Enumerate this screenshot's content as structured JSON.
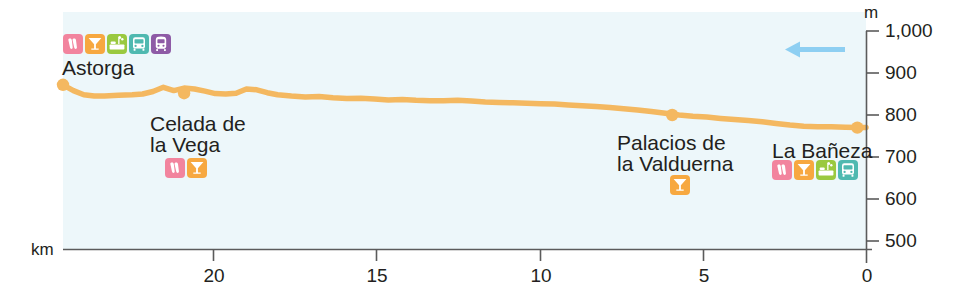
{
  "chart_data": {
    "type": "area",
    "title": "",
    "subtitle": "",
    "xlabel": "km",
    "ylabel": "m",
    "grid": false,
    "legend_position": "none",
    "xlim": [
      23.2,
      0
    ],
    "ylim": [
      500,
      1000
    ],
    "x_ticks": [
      "20",
      "15",
      "10",
      "5",
      "0"
    ],
    "x_tick_values": [
      20,
      15,
      10,
      5,
      0
    ],
    "y_ticks": [
      "500",
      "600",
      "700",
      "800",
      "900",
      "1,000"
    ],
    "y_tick_values": [
      500,
      600,
      700,
      800,
      900,
      1000
    ],
    "x_axis_direction": "descending",
    "series": [
      {
        "name": "Elevation profile",
        "color": "#f4b860",
        "x": [
          23.2,
          22.9,
          22.6,
          22.3,
          22.0,
          21.6,
          21.2,
          20.9,
          20.6,
          20.3,
          20.0,
          19.7,
          19.4,
          19.1,
          18.8,
          18.5,
          18.2,
          17.9,
          17.6,
          17.3,
          17.0,
          16.6,
          16.2,
          15.8,
          15.4,
          15.0,
          14.6,
          14.2,
          13.8,
          13.4,
          13.0,
          12.6,
          12.2,
          11.8,
          11.4,
          11.0,
          10.6,
          10.2,
          9.8,
          9.4,
          9.0,
          8.6,
          8.2,
          7.8,
          7.4,
          7.0,
          6.6,
          6.2,
          5.8,
          5.4,
          5.0,
          4.6,
          4.2,
          3.8,
          3.4,
          3.0,
          2.6,
          2.2,
          1.8,
          1.4,
          1.0,
          0.6,
          0.2,
          0.0
        ],
        "y": [
          872,
          858,
          848,
          845,
          845,
          847,
          848,
          850,
          856,
          866,
          858,
          864,
          862,
          857,
          851,
          850,
          852,
          862,
          860,
          853,
          848,
          845,
          843,
          844,
          841,
          839,
          840,
          838,
          836,
          837,
          835,
          834,
          834,
          835,
          833,
          831,
          830,
          829,
          828,
          827,
          826,
          824,
          822,
          820,
          818,
          815,
          812,
          808,
          804,
          800,
          797,
          795,
          792,
          789,
          787,
          784,
          780,
          776,
          773,
          772,
          772,
          771,
          770,
          770
        ]
      }
    ],
    "waypoints": [
      {
        "name": "Astorga",
        "km": 23.2,
        "elevation": 872
      },
      {
        "name": "Celada de la Vega",
        "km": 19.7,
        "elevation": 852
      },
      {
        "name": "Palacios de la Valduerna",
        "km": 5.6,
        "elevation": 800
      },
      {
        "name": "La Bañeza",
        "km": 0.25,
        "elevation": 770
      }
    ],
    "direction_arrow": {
      "direction": "left",
      "color": "#8ecff2"
    }
  },
  "axes": {
    "y_unit_label": "m",
    "x_unit_label": "km",
    "y_tick_labels": [
      "1,000",
      "900",
      "800",
      "700",
      "600",
      "500"
    ],
    "x_tick_labels": [
      "20",
      "15",
      "10",
      "5",
      "0"
    ],
    "axis_color": "#5b5b5b"
  },
  "places": [
    {
      "id": "astorga",
      "lines": [
        "Astorga"
      ],
      "icons": [
        "albergue-bed-icon",
        "bar-cocktail-icon",
        "hotel-icon",
        "bus-icon",
        "train-icon"
      ]
    },
    {
      "id": "celada-de-la-vega",
      "lines": [
        "Celada de",
        "la Vega"
      ],
      "icons": [
        "albergue-bed-icon",
        "bar-cocktail-icon"
      ]
    },
    {
      "id": "palacios-de-la-valduerna",
      "lines": [
        "Palacios de",
        "la Valduerna"
      ],
      "icons": [
        "bar-cocktail-icon"
      ]
    },
    {
      "id": "la-baneza",
      "lines": [
        "La Bañeza"
      ],
      "icons": [
        "albergue-bed-icon",
        "bar-cocktail-icon",
        "hotel-icon",
        "bus-icon"
      ]
    }
  ],
  "colors": {
    "profile_line": "#f4b860",
    "plot_background": "#edf7fa",
    "page_background": "#ffffff",
    "axis": "#5b5b5b",
    "text": "#231f20",
    "arrow": "#8ecff2",
    "icon_albergue": "#f2849e",
    "icon_bar": "#f6a council",
    "icon_bar_hex": "#f7a840",
    "icon_hotel": "#9ac93f",
    "icon_bus": "#4fb9b0",
    "icon_train": "#8e5ba6"
  }
}
